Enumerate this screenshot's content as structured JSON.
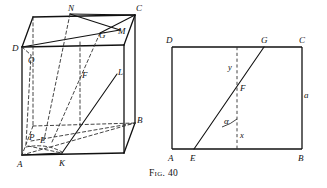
{
  "figure": {
    "caption_prefix": "Fig.",
    "caption_number": "40",
    "caption_full": "Fig. 40"
  },
  "colors": {
    "ink": "#111111",
    "paper": "#ffffff",
    "hidden_line": "#3a3a3a"
  },
  "left_figure": {
    "name": "oblique-prism-diagram",
    "labels": {
      "N": "N",
      "C": "C",
      "D": "D",
      "G": "G",
      "M": "M",
      "O": "O",
      "F": "F",
      "L": "L",
      "B": "B",
      "P": "P",
      "E": "E",
      "A": "A",
      "K": "K"
    }
  },
  "right_figure": {
    "name": "rectangle-section-diagram",
    "labels": {
      "D": "D",
      "G": "G",
      "C": "C",
      "y": "y",
      "F": "F",
      "a": "a",
      "alpha": "α",
      "x": "x",
      "A": "A",
      "E": "E",
      "B": "B"
    }
  }
}
